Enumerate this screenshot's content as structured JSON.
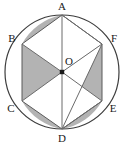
{
  "figure": {
    "name": "circle-with-inscribed-hexagon",
    "type": "geometry-diagram",
    "background_color": "#ffffff",
    "stroke_color": "#4a4a4a",
    "shade_color": "#b3b3b3",
    "center_dot_color": "#1a1a1a",
    "circle": {
      "cx": 62,
      "cy": 72,
      "r": 57
    },
    "labels": {
      "A": "A",
      "B": "B",
      "C": "C",
      "D": "D",
      "E": "E",
      "F": "F",
      "O": "O"
    },
    "label_positions": {
      "A": {
        "x": 62,
        "y": 10
      },
      "B": {
        "x": 12,
        "y": 42
      },
      "C": {
        "x": 11,
        "y": 108
      },
      "D": {
        "x": 62,
        "y": 140
      },
      "E": {
        "x": 112,
        "y": 108
      },
      "F": {
        "x": 113,
        "y": 42
      },
      "O": {
        "x": 67,
        "y": 62
      }
    },
    "vertices": {
      "A": {
        "x": 62,
        "y": 15
      },
      "B": {
        "x": 22,
        "y": 44
      },
      "C": {
        "x": 22,
        "y": 101
      },
      "D": {
        "x": 62,
        "y": 129
      },
      "E": {
        "x": 102,
        "y": 101
      },
      "F": {
        "x": 102,
        "y": 44
      },
      "O": {
        "x": 62,
        "y": 72
      }
    },
    "shaded_regions": [
      "segment-AB",
      "triangle-BOC",
      "segment-CD",
      "triangle-OFE",
      "triangle-ODE"
    ],
    "chords": [
      "AB",
      "BC",
      "CD",
      "DE",
      "EF",
      "FA",
      "AF",
      "DF",
      "AE"
    ],
    "radii": [
      "OA",
      "OB",
      "OC",
      "OD",
      "OE",
      "OF"
    ]
  }
}
